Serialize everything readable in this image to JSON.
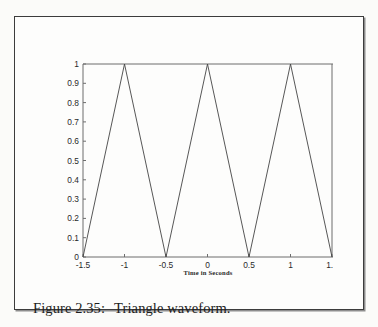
{
  "figure": {
    "caption_label": "Figure 2.35:",
    "caption_text": "Triangle waveform."
  },
  "chart_data": {
    "type": "line",
    "title": "",
    "xlabel": "Time in Seconds",
    "ylabel": "",
    "xlim": [
      -1.5,
      1.5
    ],
    "ylim": [
      0,
      1
    ],
    "grid": false,
    "legend": null,
    "xticks": [
      -1.5,
      -1,
      -0.5,
      0,
      0.5,
      1,
      1.5
    ],
    "xtick_labels": [
      "-1.5",
      "-1",
      "-0.5",
      "0",
      "0.5",
      "1",
      "1.5"
    ],
    "yticks": [
      0,
      0.1,
      0.2,
      0.3,
      0.4,
      0.5,
      0.6,
      0.7,
      0.8,
      0.9,
      1
    ],
    "ytick_labels": [
      "0",
      "0.1",
      "0.2",
      "0.3",
      "0.4",
      "0.5",
      "0.6",
      "0.7",
      "0.8",
      "0.9",
      "1"
    ],
    "line_color": "#444444",
    "series": [
      {
        "name": "triangle",
        "x": [
          -1.5,
          -1,
          -0.5,
          0,
          0.5,
          1,
          1.5
        ],
        "y": [
          0,
          1,
          0,
          1,
          0,
          1,
          0
        ]
      }
    ]
  },
  "colors": {
    "page_background": "#fbfbf9",
    "frame_border": "#3c3c3c",
    "axis": "#6d6d6d",
    "text": "#1d1d1d"
  }
}
